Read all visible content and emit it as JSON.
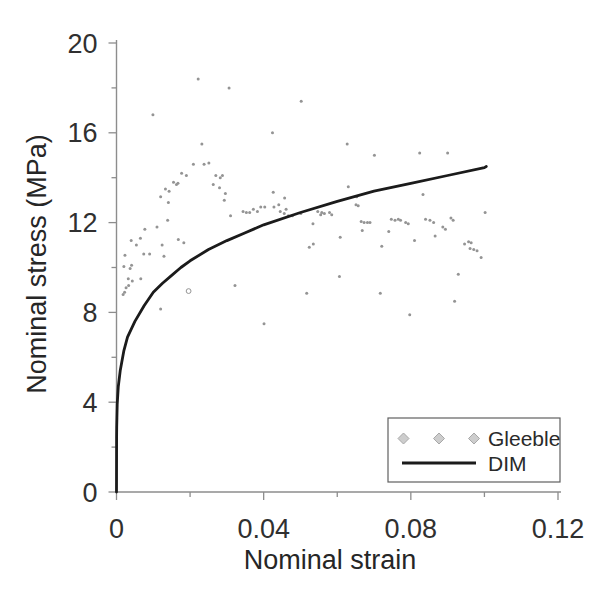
{
  "figure": {
    "background": "#ffffff"
  },
  "chart_data": {
    "type": "scatter+line",
    "title": "",
    "xlabel": "Nominal strain",
    "ylabel": "Nominal stress (MPa)",
    "xlim": [
      0,
      0.12
    ],
    "ylim": [
      0,
      20
    ],
    "grid": false,
    "x_major_ticks": [
      0,
      0.04,
      0.08,
      0.12
    ],
    "x_tick_labels": [
      "0",
      "0.04",
      "0.08",
      "0.12"
    ],
    "x_minor_ticks": [
      0.02,
      0.06,
      0.1
    ],
    "y_major_ticks": [
      0,
      4,
      8,
      12,
      16,
      20
    ],
    "y_tick_labels": [
      "0",
      "4",
      "8",
      "12",
      "16",
      "20"
    ],
    "y_minor_ticks": [
      2,
      6,
      10,
      14,
      18
    ],
    "axis_color": "#8d8d8d",
    "legend": {
      "position": "lower-right",
      "entries": [
        {
          "label": "Gleeble",
          "type": "scatter",
          "marker": "diamond",
          "color": "#cdcdcd"
        },
        {
          "label": "DIM",
          "type": "line",
          "color": "#1b1b1b"
        }
      ]
    },
    "series": [
      {
        "name": "Gleeble",
        "type": "scatter",
        "marker_color": "#949494",
        "points": [
          [
            0.0222,
            18.4
          ],
          [
            0.0306,
            18.0
          ],
          [
            0.0099,
            16.8
          ],
          [
            0.0502,
            17.4
          ],
          [
            0.0424,
            16.0
          ],
          [
            0.0232,
            15.5
          ],
          [
            0.0627,
            15.5
          ],
          [
            0.0701,
            15.0
          ],
          [
            0.0824,
            15.1
          ],
          [
            0.09,
            15.1
          ],
          [
            0.0209,
            14.6
          ],
          [
            0.0238,
            14.6
          ],
          [
            0.0251,
            14.65
          ],
          [
            0.0177,
            14.2
          ],
          [
            0.019,
            14.1
          ],
          [
            0.027,
            14.1
          ],
          [
            0.0282,
            14.0
          ],
          [
            0.0288,
            14.1
          ],
          [
            0.0163,
            13.7
          ],
          [
            0.0155,
            13.8
          ],
          [
            0.0167,
            13.75
          ],
          [
            0.0133,
            13.5
          ],
          [
            0.0143,
            13.4
          ],
          [
            0.012,
            13.15
          ],
          [
            0.0263,
            13.7
          ],
          [
            0.028,
            13.55
          ],
          [
            0.0296,
            13.3
          ],
          [
            0.0141,
            12.9
          ],
          [
            0.0139,
            12.1
          ],
          [
            0.011,
            11.8
          ],
          [
            0.0077,
            11.7
          ],
          [
            0.0065,
            11.3
          ],
          [
            0.004,
            11.2
          ],
          [
            0.0054,
            11.0
          ],
          [
            0.0124,
            11.0
          ],
          [
            0.0168,
            11.25
          ],
          [
            0.0183,
            11.1
          ],
          [
            0.009,
            10.6
          ],
          [
            0.0074,
            10.6
          ],
          [
            0.0023,
            10.55
          ],
          [
            0.0129,
            10.5
          ],
          [
            0.0041,
            10.1
          ],
          [
            0.002,
            10.05
          ],
          [
            0.0037,
            9.95
          ],
          [
            0.0032,
            9.5
          ],
          [
            0.0043,
            9.4
          ],
          [
            0.0066,
            9.5
          ],
          [
            0.0033,
            9.2
          ],
          [
            0.0026,
            9.1
          ],
          [
            0.0022,
            8.9
          ],
          [
            0.0018,
            8.8
          ],
          [
            0.012,
            8.15
          ],
          [
            0.0196,
            8.95,
            "o"
          ],
          [
            0.0322,
            9.2
          ],
          [
            0.0293,
            13.0
          ],
          [
            0.031,
            12.3
          ],
          [
            0.0344,
            12.5
          ],
          [
            0.0353,
            12.45
          ],
          [
            0.0362,
            12.45
          ],
          [
            0.0372,
            12.6
          ],
          [
            0.0383,
            12.5
          ],
          [
            0.0392,
            12.7
          ],
          [
            0.0403,
            12.7
          ],
          [
            0.0426,
            13.35
          ],
          [
            0.0428,
            12.7
          ],
          [
            0.0441,
            12.8
          ],
          [
            0.0445,
            12.5
          ],
          [
            0.0456,
            12.4
          ],
          [
            0.0461,
            12.6
          ],
          [
            0.0467,
            12.3
          ],
          [
            0.0478,
            12.3
          ],
          [
            0.0457,
            13.1
          ],
          [
            0.0501,
            12.4
          ],
          [
            0.0547,
            12.5
          ],
          [
            0.0558,
            12.45
          ],
          [
            0.0565,
            12.4
          ],
          [
            0.0555,
            12.35
          ],
          [
            0.0579,
            12.45
          ],
          [
            0.0585,
            12.35
          ],
          [
            0.0534,
            11.95
          ],
          [
            0.0524,
            10.9
          ],
          [
            0.0535,
            11.05
          ],
          [
            0.0608,
            11.35
          ],
          [
            0.063,
            13.6
          ],
          [
            0.0653,
            13.15
          ],
          [
            0.0651,
            12.8
          ],
          [
            0.0657,
            12.75
          ],
          [
            0.0665,
            12.05
          ],
          [
            0.0673,
            12.0
          ],
          [
            0.0682,
            12.0
          ],
          [
            0.0689,
            12.0
          ],
          [
            0.0668,
            11.65
          ],
          [
            0.074,
            11.6
          ],
          [
            0.0747,
            12.15
          ],
          [
            0.0757,
            12.1
          ],
          [
            0.0766,
            12.15
          ],
          [
            0.0772,
            12.1
          ],
          [
            0.0786,
            12.0
          ],
          [
            0.0793,
            11.95
          ],
          [
            0.0721,
            10.95
          ],
          [
            0.081,
            11.2
          ],
          [
            0.0833,
            13.25
          ],
          [
            0.084,
            12.15
          ],
          [
            0.0852,
            12.1
          ],
          [
            0.0862,
            12.0
          ],
          [
            0.0866,
            11.4
          ],
          [
            0.0887,
            11.8
          ],
          [
            0.0894,
            11.7
          ],
          [
            0.0909,
            12.2
          ],
          [
            0.0915,
            12.1
          ],
          [
            0.0946,
            11.05
          ],
          [
            0.0957,
            11.15
          ],
          [
            0.0964,
            11.1
          ],
          [
            0.0961,
            10.85
          ],
          [
            0.0971,
            10.8
          ],
          [
            0.098,
            10.75
          ],
          [
            0.0991,
            10.45
          ],
          [
            0.1002,
            12.45
          ],
          [
            0.0929,
            9.7
          ],
          [
            0.0606,
            9.6
          ],
          [
            0.0517,
            8.85
          ],
          [
            0.0717,
            8.85
          ],
          [
            0.0919,
            8.5
          ],
          [
            0.0797,
            7.9
          ],
          [
            0.0401,
            7.5
          ]
        ]
      },
      {
        "name": "DIM",
        "type": "line",
        "color": "#1b1b1b",
        "width": 2.8,
        "points": [
          [
            0,
            0
          ],
          [
            2e-05,
            2.4
          ],
          [
            5e-05,
            2.9
          ],
          [
            0.0001,
            3.3
          ],
          [
            0.0002,
            3.9
          ],
          [
            0.0005,
            4.7
          ],
          [
            0.001,
            5.4
          ],
          [
            0.002,
            6.3
          ],
          [
            0.003,
            6.9
          ],
          [
            0.005,
            7.6
          ],
          [
            0.0075,
            8.3
          ],
          [
            0.01,
            8.9
          ],
          [
            0.0125,
            9.3
          ],
          [
            0.015,
            9.65
          ],
          [
            0.0175,
            10.0
          ],
          [
            0.02,
            10.3
          ],
          [
            0.025,
            10.8
          ],
          [
            0.03,
            11.2
          ],
          [
            0.035,
            11.55
          ],
          [
            0.04,
            11.9
          ],
          [
            0.05,
            12.45
          ],
          [
            0.06,
            12.95
          ],
          [
            0.07,
            13.4
          ],
          [
            0.08,
            13.75
          ],
          [
            0.09,
            14.1
          ],
          [
            0.1,
            14.45
          ],
          [
            0.1005,
            14.5
          ]
        ]
      }
    ]
  }
}
